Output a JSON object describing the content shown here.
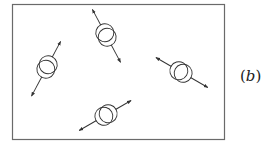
{
  "figure": {
    "label_open": "(",
    "label_letter": "b",
    "label_close": ")",
    "frame": {
      "x": 12,
      "y": 4,
      "width": 212,
      "height": 135
    },
    "molecules": [
      {
        "id": "left",
        "cx": 47,
        "cy": 67,
        "angle": -62,
        "arrow_up": 18,
        "arrow_down": 22
      },
      {
        "id": "top",
        "cx": 106,
        "cy": 35,
        "angle": 62,
        "arrow_up": 20,
        "arrow_down": 18
      },
      {
        "id": "right",
        "cx": 181,
        "cy": 72,
        "angle": 30,
        "arrow_up": 20,
        "arrow_down": 18
      },
      {
        "id": "bottom",
        "cx": 106,
        "cy": 115,
        "angle": -30,
        "arrow_up": 18,
        "arrow_down": 20
      }
    ],
    "colors": {
      "stroke": "#333333",
      "frame": "#6a6a6a",
      "background": "#ffffff"
    }
  }
}
